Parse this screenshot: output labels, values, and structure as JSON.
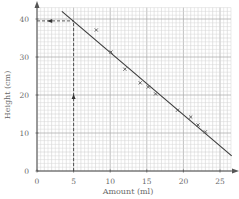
{
  "chart_data": {
    "type": "scatter",
    "title": "",
    "xlabel": "Amount (ml)",
    "ylabel": "Height (cm)",
    "xlim": [
      0,
      26.5
    ],
    "ylim": [
      0,
      43
    ],
    "x_ticks": [
      0,
      5,
      10,
      15,
      20,
      25
    ],
    "y_ticks": [
      0,
      10,
      20,
      30,
      40
    ],
    "grid": true,
    "legend": null,
    "series": [
      {
        "name": "measurements",
        "marker": "x",
        "points": [
          {
            "x": 8.1,
            "y": 37.1
          },
          {
            "x": 10.1,
            "y": 31.3
          },
          {
            "x": 12.0,
            "y": 26.8
          },
          {
            "x": 14.1,
            "y": 23.2
          },
          {
            "x": 15.2,
            "y": 22.1
          },
          {
            "x": 16.2,
            "y": 20.3
          },
          {
            "x": 19.2,
            "y": 16.0
          },
          {
            "x": 21.0,
            "y": 14.2
          },
          {
            "x": 22.0,
            "y": 12.1
          },
          {
            "x": 23.0,
            "y": 10.3
          }
        ]
      }
    ],
    "best_fit_line": {
      "x1": 3.4,
      "y1": 42.0,
      "x2": 26.6,
      "y2": 4.0
    },
    "annotations": [
      {
        "type": "dashed-vertical",
        "x": 5,
        "from_y": 0,
        "to_y": 39.5,
        "arrow_at_y": 19.5,
        "arrow_direction": "up"
      },
      {
        "type": "dashed-horizontal",
        "y": 39.5,
        "from_x": 0,
        "to_x": 5,
        "arrow_at_x": 1.8,
        "arrow_direction": "left"
      }
    ]
  },
  "labels": {
    "xlabel": "Amount (ml)",
    "ylabel": "Height (cm)",
    "x_ticks": [
      "0",
      "5",
      "10",
      "15",
      "20",
      "25"
    ],
    "y_ticks": [
      "0",
      "10",
      "20",
      "30",
      "40"
    ]
  },
  "colors": {
    "grid_minor": "#d6d6d6",
    "grid_major": "#b0b0b0",
    "axis": "#555555",
    "line": "#3a3a3a",
    "marker": "#5a5a5a",
    "text": "#6a6a6a"
  }
}
